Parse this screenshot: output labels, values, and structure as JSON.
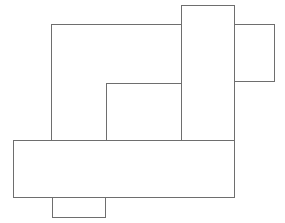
{
  "figure": {
    "canvas": {
      "width": 285,
      "height": 223,
      "background": "#ffffff"
    },
    "stroke": {
      "color": "#6e6e6e",
      "width": 1
    },
    "rectangles": [
      {
        "name": "rect-top-right-small",
        "x": 210,
        "y": 24,
        "w": 65,
        "h": 58,
        "note": "visible part x 235-275, y 24-82; left side hidden under tall rectangle"
      },
      {
        "name": "rect-large",
        "x": 51,
        "y": 24,
        "w": 154,
        "h": 126,
        "note": "top-left large rectangle; right side hidden under tall rectangle, bottom hidden under wide rectangle"
      },
      {
        "name": "rect-inner",
        "x": 106,
        "y": 83,
        "w": 76,
        "h": 62,
        "note": "inner rectangle; bottom hidden under wide rectangle"
      },
      {
        "name": "rect-tall-vertical",
        "x": 181,
        "y": 5,
        "w": 54,
        "h": 155,
        "note": "tall vertical rectangle at top; lower part hidden under wide rectangle"
      },
      {
        "name": "rect-bottom-small",
        "x": 52,
        "y": 190,
        "w": 54,
        "h": 28,
        "note": "small tab below; top hidden under wide rectangle, visible y 198-218"
      },
      {
        "name": "rect-wide-horizontal",
        "x": 13,
        "y": 140,
        "w": 222,
        "h": 58,
        "note": "wide horizontal rectangle drawn on top, spans x 13-235, y 140-198"
      }
    ]
  }
}
